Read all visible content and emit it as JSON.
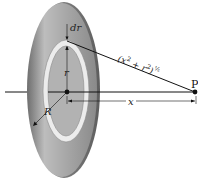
{
  "diagram": {
    "labels": {
      "dr": "dr",
      "r": "r",
      "R": "R",
      "x": "x",
      "distance_base": "(x",
      "distance_sup1": "2",
      "distance_mid": " + r",
      "distance_sup2": "2",
      "distance_close": ")",
      "distance_exp": "½",
      "point": "P"
    },
    "colors": {
      "disk_dark": "#7a7a7a",
      "disk_light": "#cfcfcf",
      "ring": "#ececec",
      "lines": "#111111",
      "background": "#ffffff"
    }
  }
}
